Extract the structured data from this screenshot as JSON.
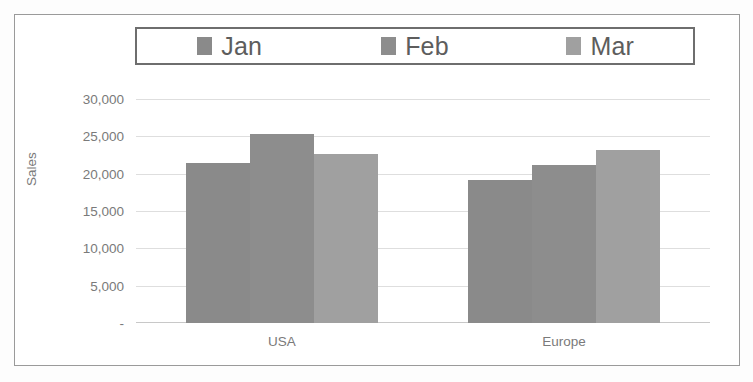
{
  "chart_data": {
    "type": "bar",
    "title": "",
    "xlabel": "",
    "ylabel": "Sales",
    "categories": [
      "USA",
      "Europe"
    ],
    "series": [
      {
        "name": "Jan",
        "values": [
          21400,
          19100
        ],
        "color": "#8a8a8a"
      },
      {
        "name": "Feb",
        "values": [
          25300,
          21100
        ],
        "color": "#8d8d8d"
      },
      {
        "name": "Mar",
        "values": [
          22700,
          23200
        ],
        "color": "#a0a0a0"
      }
    ],
    "ylim": [
      0,
      30000
    ],
    "ytick_values": [
      30000,
      25000,
      20000,
      15000,
      10000,
      5000,
      0
    ],
    "ytick_labels": [
      "30,000",
      "25,000",
      "20,000",
      "15,000",
      "10,000",
      "5,000",
      "-"
    ],
    "grid": true,
    "legend_position": "top",
    "bar_mode": "grouped"
  },
  "legend": {
    "items": [
      {
        "label": "Jan",
        "swatch_color": "#8a8a8a"
      },
      {
        "label": "Feb",
        "swatch_color": "#8d8d8d"
      },
      {
        "label": "Mar",
        "swatch_color": "#a0a0a0"
      }
    ]
  },
  "axes": {
    "y_title": "Sales",
    "y_ticks": [
      "30,000",
      "25,000",
      "20,000",
      "15,000",
      "10,000",
      "5,000",
      "-"
    ],
    "x_ticks": [
      "USA",
      "Europe"
    ]
  },
  "style": {
    "frame_color": "#9a9a9a",
    "gridline_color": "#dedede",
    "text_color": "#7a7a7a"
  }
}
